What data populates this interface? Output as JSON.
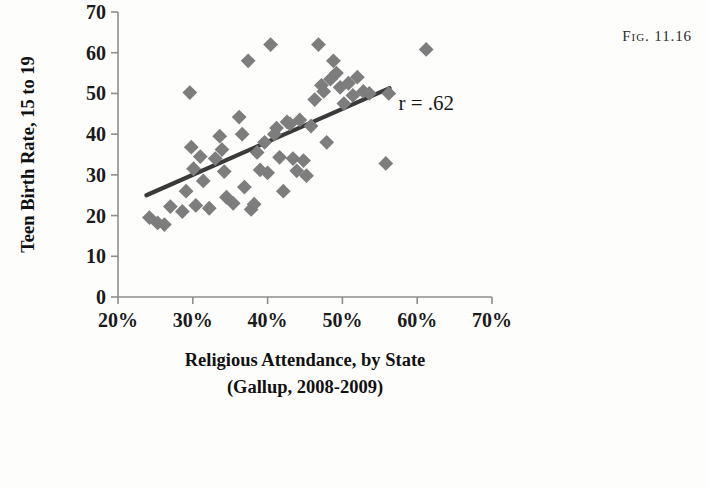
{
  "figure": {
    "label": "Fig. 11.16"
  },
  "chart_data": {
    "type": "scatter",
    "title": "",
    "xlabel": "Religious Attendance, by State",
    "xlabel_line2": "(Gallup, 2008-2009)",
    "ylabel": "Teen Birth Rate, 15 to 19",
    "xlim": [
      20,
      70
    ],
    "ylim": [
      0,
      70
    ],
    "xticks": [
      20,
      30,
      40,
      50,
      60,
      70
    ],
    "xtick_labels": [
      "20%",
      "30%",
      "40%",
      "50%",
      "60%",
      "70%"
    ],
    "yticks": [
      0,
      10,
      20,
      30,
      40,
      50,
      60,
      70
    ],
    "ytick_labels": [
      "0",
      "10",
      "20",
      "30",
      "40",
      "50",
      "60",
      "70"
    ],
    "grid": false,
    "legend": "none",
    "marker": "diamond",
    "marker_color": "#7d7d7d",
    "annotations": [
      {
        "text": "r = .62",
        "x": 57.5,
        "y": 46
      }
    ],
    "trendline": {
      "color": "#3a3a3a",
      "x0": 23.8,
      "y0": 25.0,
      "x1": 56.3,
      "y1": 51.3
    },
    "points": [
      {
        "x": 24.2,
        "y": 19.5
      },
      {
        "x": 25.3,
        "y": 18.2
      },
      {
        "x": 26.2,
        "y": 17.8
      },
      {
        "x": 27.0,
        "y": 22.2
      },
      {
        "x": 28.6,
        "y": 21.0
      },
      {
        "x": 29.1,
        "y": 26.0
      },
      {
        "x": 29.6,
        "y": 50.2
      },
      {
        "x": 29.8,
        "y": 36.8
      },
      {
        "x": 30.1,
        "y": 31.5
      },
      {
        "x": 30.4,
        "y": 22.5
      },
      {
        "x": 31.0,
        "y": 34.5
      },
      {
        "x": 31.4,
        "y": 28.5
      },
      {
        "x": 32.2,
        "y": 21.8
      },
      {
        "x": 33.0,
        "y": 34.0
      },
      {
        "x": 33.6,
        "y": 39.5
      },
      {
        "x": 33.9,
        "y": 36.2
      },
      {
        "x": 34.2,
        "y": 30.8
      },
      {
        "x": 34.5,
        "y": 24.5
      },
      {
        "x": 35.4,
        "y": 23.0
      },
      {
        "x": 36.2,
        "y": 44.2
      },
      {
        "x": 36.6,
        "y": 40.0
      },
      {
        "x": 36.9,
        "y": 27.0
      },
      {
        "x": 37.4,
        "y": 58.0
      },
      {
        "x": 37.8,
        "y": 21.5
      },
      {
        "x": 38.2,
        "y": 22.8
      },
      {
        "x": 38.6,
        "y": 35.5
      },
      {
        "x": 39.0,
        "y": 31.2
      },
      {
        "x": 39.6,
        "y": 38.0
      },
      {
        "x": 40.0,
        "y": 30.5
      },
      {
        "x": 40.4,
        "y": 62.0
      },
      {
        "x": 40.9,
        "y": 40.0
      },
      {
        "x": 41.2,
        "y": 41.5
      },
      {
        "x": 41.6,
        "y": 34.3
      },
      {
        "x": 42.1,
        "y": 26.0
      },
      {
        "x": 42.6,
        "y": 43.0
      },
      {
        "x": 43.0,
        "y": 42.5
      },
      {
        "x": 43.4,
        "y": 34.0
      },
      {
        "x": 43.9,
        "y": 31.0
      },
      {
        "x": 44.3,
        "y": 43.5
      },
      {
        "x": 44.8,
        "y": 33.5
      },
      {
        "x": 45.2,
        "y": 29.8
      },
      {
        "x": 45.8,
        "y": 42.0
      },
      {
        "x": 46.3,
        "y": 48.5
      },
      {
        "x": 46.8,
        "y": 62.0
      },
      {
        "x": 47.2,
        "y": 52.0
      },
      {
        "x": 47.5,
        "y": 50.5
      },
      {
        "x": 47.9,
        "y": 38.0
      },
      {
        "x": 48.4,
        "y": 53.5
      },
      {
        "x": 48.8,
        "y": 58.0
      },
      {
        "x": 49.2,
        "y": 55.0
      },
      {
        "x": 49.7,
        "y": 51.5
      },
      {
        "x": 50.2,
        "y": 47.5
      },
      {
        "x": 50.8,
        "y": 52.5
      },
      {
        "x": 51.4,
        "y": 49.5
      },
      {
        "x": 52.0,
        "y": 54.0
      },
      {
        "x": 52.8,
        "y": 50.5
      },
      {
        "x": 53.6,
        "y": 50.0
      },
      {
        "x": 55.8,
        "y": 32.8
      },
      {
        "x": 56.2,
        "y": 50.0
      },
      {
        "x": 61.2,
        "y": 60.8
      }
    ]
  }
}
